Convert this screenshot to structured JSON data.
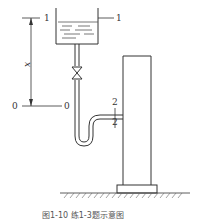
{
  "labels": {
    "section1_left": "1",
    "section1_right": "1",
    "section0_left": "0",
    "section0_right": "0",
    "section2_top": "2",
    "section2_bottom": "2",
    "height_var": "x"
  },
  "caption": "图1-10  练1-3题示意图",
  "colors": {
    "line": "#333333",
    "background": "#ffffff"
  }
}
